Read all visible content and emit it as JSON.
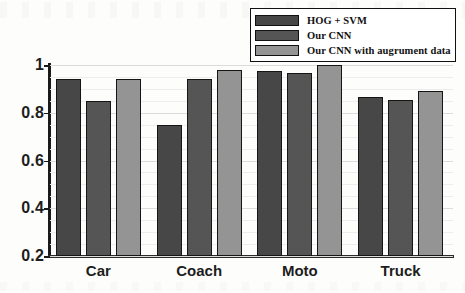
{
  "chart_data": {
    "type": "bar",
    "title": "",
    "xlabel": "",
    "ylabel": "",
    "categories": [
      "Car",
      "Coach",
      "Moto",
      "Truck"
    ],
    "series": [
      {
        "name": "HOG + SVM",
        "values": [
          0.94,
          0.75,
          0.975,
          0.865
        ],
        "color": "#474747"
      },
      {
        "name": "Our CNN",
        "values": [
          0.85,
          0.94,
          0.965,
          0.855
        ],
        "color": "#555555"
      },
      {
        "name": "Our CNN with augrument data",
        "values": [
          0.94,
          0.98,
          1.0,
          0.89
        ],
        "color": "#949494"
      }
    ],
    "ylim": [
      0.2,
      1.0
    ],
    "ytick_labels": [
      "0.2",
      "0.4",
      "0.6",
      "0.8",
      "1"
    ],
    "ytick_values": [
      0.2,
      0.4,
      0.6,
      0.8,
      1.0
    ],
    "grid": true,
    "legend_position": "top-right",
    "bar_edge_color": "#151515",
    "axis_color": "#1a1a1a"
  }
}
